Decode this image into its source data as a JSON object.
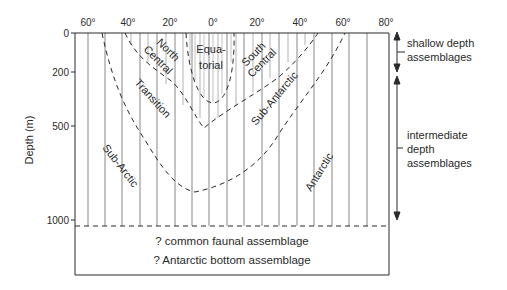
{
  "diagram": {
    "x_axis": {
      "ticks": [
        {
          "label": "60°",
          "x": 88
        },
        {
          "label": "40°",
          "x": 128
        },
        {
          "label": "20°",
          "x": 170
        },
        {
          "label": "0°",
          "x": 213
        },
        {
          "label": "20°",
          "x": 257
        },
        {
          "label": "40°",
          "x": 300
        },
        {
          "label": "60°",
          "x": 343
        },
        {
          "label": "80°",
          "x": 386
        }
      ]
    },
    "y_axis": {
      "label": "Depth (m)",
      "ticks": [
        {
          "label": "0",
          "y": 33
        },
        {
          "label": "200",
          "y": 72
        },
        {
          "label": "500",
          "y": 126
        },
        {
          "label": "1000",
          "y": 220
        }
      ]
    },
    "regions": {
      "north_central": [
        "North",
        "Central"
      ],
      "equatorial": [
        "Equa-",
        "torial"
      ],
      "south_central": [
        "South",
        "Central"
      ],
      "transition": "Transition",
      "sub_antarctic": "Sub-Antarctic",
      "sub_arctic": "Sub-Arctic",
      "antarctic": "Antarctic"
    },
    "bottom_box": {
      "line1": "? common faunal assemblage",
      "line2": "? Antarctic bottom assemblage"
    },
    "legend": {
      "shallow": [
        "shallow depth",
        "assemblages"
      ],
      "intermediate": [
        "intermediate",
        "depth",
        "assemblages"
      ]
    },
    "colors": {
      "ink": "#2a2a2a",
      "background": "#ffffff"
    }
  }
}
